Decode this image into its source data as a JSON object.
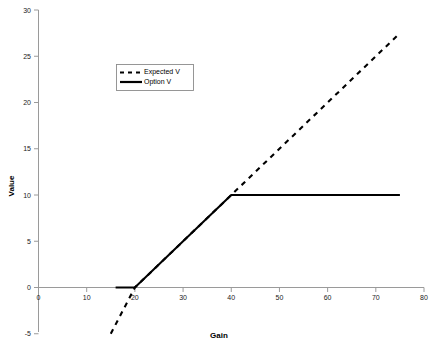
{
  "chart_data": {
    "type": "line",
    "title": "",
    "xlabel": "Gain",
    "ylabel": "Value",
    "xlim": [
      0,
      80
    ],
    "ylim": [
      -5,
      30
    ],
    "xticks": [
      0,
      10,
      20,
      30,
      40,
      50,
      60,
      70,
      80
    ],
    "xtick_labels": [
      "0",
      "10",
      "20",
      "30",
      "40",
      "50",
      "60",
      "70",
      "80"
    ],
    "yticks": [
      -5,
      0,
      5,
      10,
      15,
      20,
      25,
      30
    ],
    "ytick_labels": [
      "-5",
      "0",
      "5",
      "10",
      "15",
      "20",
      "25",
      "30"
    ],
    "grid": false,
    "legend_position": "upper-left-inside",
    "series": [
      {
        "name": "Expected V",
        "style": "dashed",
        "color": "#000000",
        "x": [
          15,
          20,
          40,
          75
        ],
        "values": [
          -5,
          0,
          10,
          27.5
        ]
      },
      {
        "name": "Option V",
        "style": "solid",
        "color": "#000000",
        "x": [
          16,
          20,
          40,
          75
        ],
        "values": [
          0,
          0,
          10,
          10
        ]
      }
    ]
  },
  "axes": {
    "x_title": "Gain",
    "y_title": "Value"
  },
  "legend": {
    "entries": [
      {
        "label": "Expected V",
        "style": "dashed"
      },
      {
        "label": "Option V",
        "style": "solid"
      }
    ]
  },
  "colors": {
    "axis": "#9a9a9a",
    "series": "#000000",
    "background": "#ffffff",
    "legend_border": "#8c8c8c"
  }
}
